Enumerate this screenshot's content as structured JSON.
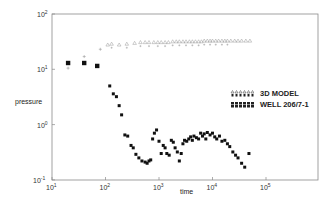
{
  "chart_data": {
    "type": "scatter",
    "title": "",
    "xlabel": "time",
    "ylabel": "pressure",
    "xscale": "log",
    "yscale": "log",
    "xlim": [
      10,
      1000000
    ],
    "ylim": [
      0.1,
      100
    ],
    "x_ticks": [
      "10^1",
      "10^2",
      "10^3",
      "10^4",
      "10^5"
    ],
    "y_ticks": [
      "10^-1",
      "10^0",
      "10^1",
      "10^2"
    ],
    "grid": false,
    "legend_position": "right-center",
    "series": [
      {
        "name": "3D MODEL",
        "marker": "triangle/plus",
        "x": [
          20,
          40,
          80,
          110,
          130,
          180,
          250,
          350,
          450,
          550,
          650,
          800,
          950,
          1100,
          1300,
          1500,
          1800,
          2100,
          2400,
          2800,
          3200,
          3700,
          4200,
          4800,
          5500,
          6200,
          7000,
          8000,
          9000,
          10000,
          11500,
          13000,
          15000,
          17000,
          19000,
          22000,
          26000,
          30000,
          35000,
          42000,
          50000
        ],
        "y": [
          10.5,
          17,
          23,
          28,
          29,
          28,
          29,
          30,
          31,
          31,
          31,
          31,
          31,
          31,
          31,
          31,
          32,
          32,
          32,
          32,
          32,
          32,
          32,
          32,
          32,
          32,
          33,
          33,
          33,
          33,
          33,
          33,
          33,
          33,
          33,
          33,
          33,
          33,
          33,
          33,
          33
        ]
      },
      {
        "name": "WELL 206/7-1",
        "marker": "filled-square/circle",
        "x": [
          20,
          40,
          70,
          120,
          140,
          160,
          180,
          200,
          230,
          260,
          300,
          330,
          370,
          420,
          480,
          550,
          600,
          650,
          700,
          760,
          820,
          900,
          1000,
          1100,
          1200,
          1300,
          1400,
          1550,
          1700,
          1850,
          2000,
          2200,
          2400,
          2600,
          2800,
          3000,
          3300,
          3600,
          3900,
          4200,
          4500,
          5000,
          5500,
          6000,
          6500,
          7000,
          7500,
          8000,
          9000,
          10000,
          11000,
          12000,
          13500,
          15000,
          17000,
          19000,
          21000,
          24000,
          27000,
          30000,
          35000,
          40000,
          48000
        ],
        "y": [
          13,
          13,
          11.5,
          5,
          3.6,
          3.2,
          2.2,
          1.5,
          0.65,
          0.62,
          0.42,
          0.38,
          0.29,
          0.25,
          0.22,
          0.21,
          0.2,
          0.22,
          0.23,
          0.55,
          0.7,
          0.8,
          0.5,
          0.3,
          0.42,
          0.38,
          0.3,
          0.28,
          0.52,
          0.48,
          0.38,
          0.32,
          0.22,
          0.3,
          0.45,
          0.52,
          0.5,
          0.55,
          0.6,
          0.52,
          0.62,
          0.58,
          0.55,
          0.7,
          0.62,
          0.68,
          0.55,
          0.72,
          0.65,
          0.7,
          0.6,
          0.55,
          0.62,
          0.5,
          0.52,
          0.45,
          0.4,
          0.32,
          0.28,
          0.25,
          0.2,
          0.17,
          0.3
        ]
      }
    ]
  },
  "axes": {
    "xlabel": "time",
    "ylabel": "pressure",
    "x_tick_labels": [
      {
        "base": "10",
        "exp": "1"
      },
      {
        "base": "10",
        "exp": "2"
      },
      {
        "base": "10",
        "exp": "3"
      },
      {
        "base": "10",
        "exp": "4"
      },
      {
        "base": "10",
        "exp": "5"
      }
    ],
    "y_tick_labels": [
      {
        "base": "10",
        "exp": "2"
      },
      {
        "base": "10",
        "exp": "1"
      },
      {
        "base": "10",
        "exp": "0"
      },
      {
        "base": "10",
        "exp": "-1"
      }
    ]
  },
  "legend": {
    "items": [
      {
        "label": "3D MODEL"
      },
      {
        "label": "WELL 206/7-1"
      }
    ]
  },
  "colors": {
    "axis": "#8a8a8a",
    "model": "#9a9a9a",
    "well": "#111111"
  }
}
